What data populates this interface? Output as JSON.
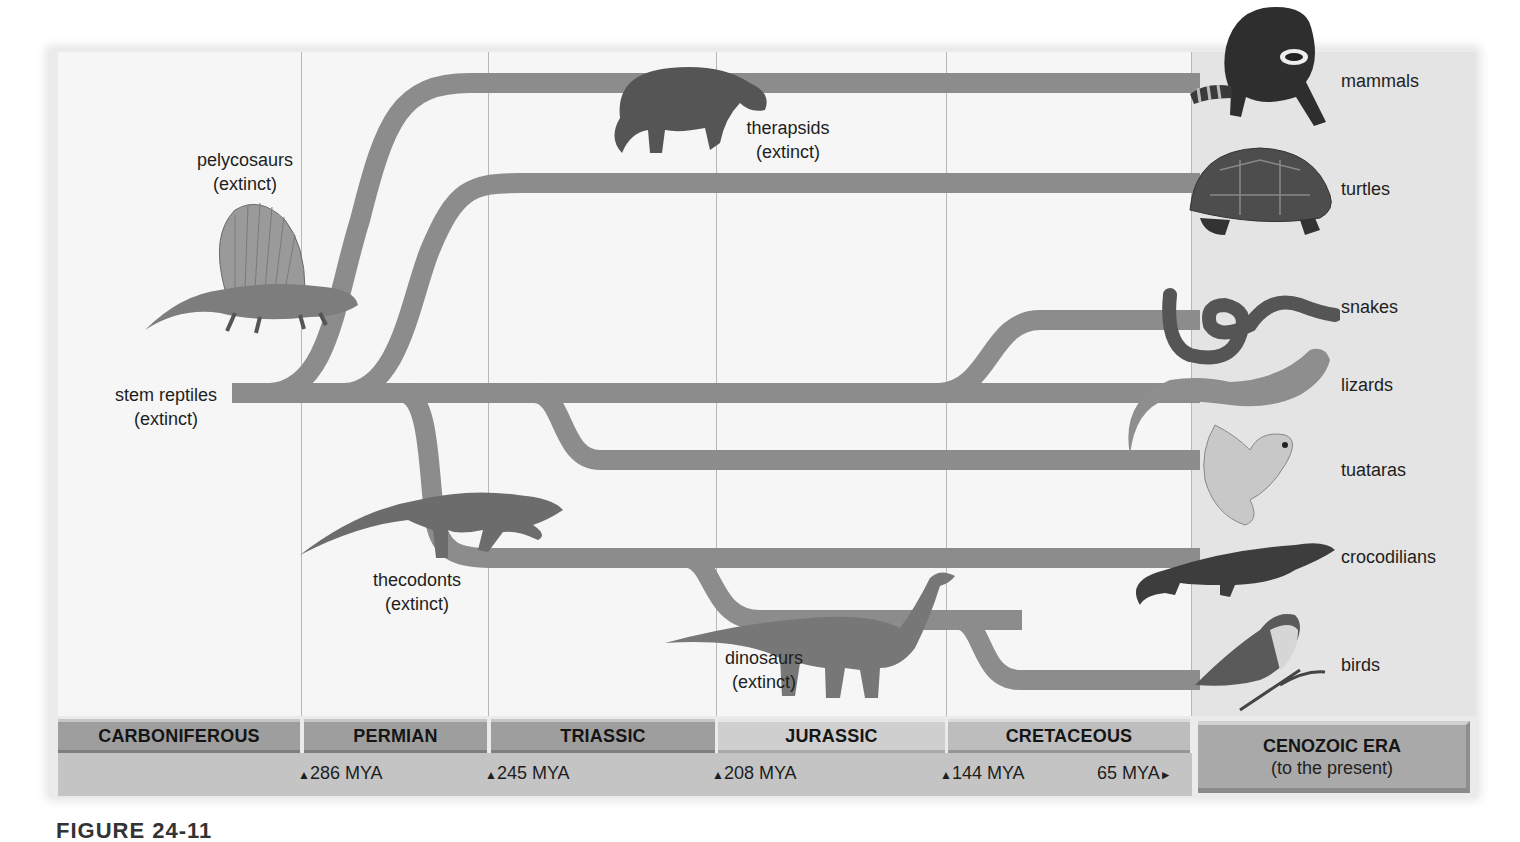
{
  "diagram": {
    "type": "phylogenetic-tree",
    "colors": {
      "branch": "#8c8c8c",
      "background": "#f6f6f6",
      "cenozoic_background": "#e4e4e4",
      "period_dark": "#9e9e9e",
      "period_light": "#cfcfcf",
      "mya_band": "#c4c4c4"
    },
    "ancestors": {
      "stem_reptiles": {
        "name": "stem reptiles",
        "status": "(extinct)"
      },
      "pelycosaurs": {
        "name": "pelycosaurs",
        "status": "(extinct)"
      },
      "therapsids": {
        "name": "therapsids",
        "status": "(extinct)"
      },
      "thecodonts": {
        "name": "thecodonts",
        "status": "(extinct)"
      },
      "dinosaurs": {
        "name": "dinosaurs",
        "status": "(extinct)"
      }
    },
    "living_groups": [
      {
        "name": "mammals",
        "icon": "raccoon-icon"
      },
      {
        "name": "turtles",
        "icon": "turtle-icon"
      },
      {
        "name": "snakes",
        "icon": "snake-icon"
      },
      {
        "name": "lizards",
        "icon": "lizard-icon"
      },
      {
        "name": "tuataras",
        "icon": "tuatara-icon"
      },
      {
        "name": "crocodilians",
        "icon": "crocodile-icon"
      },
      {
        "name": "birds",
        "icon": "bird-icon"
      }
    ],
    "periods": [
      {
        "name": "CARBONIFEROUS"
      },
      {
        "name": "PERMIAN"
      },
      {
        "name": "TRIASSIC"
      },
      {
        "name": "JURASSIC"
      },
      {
        "name": "CRETACEOUS"
      }
    ],
    "era": {
      "name": "CENOZOIC ERA",
      "subtitle": "(to the present)"
    },
    "boundaries": [
      {
        "label": "286 MYA",
        "marker": "▲"
      },
      {
        "label": "245 MYA",
        "marker": "▲"
      },
      {
        "label": "208 MYA",
        "marker": "▲"
      },
      {
        "label": "144 MYA",
        "marker": "▲"
      },
      {
        "label": "65 MYA",
        "marker": "►"
      }
    ],
    "caption": "FIGURE 24-11"
  }
}
